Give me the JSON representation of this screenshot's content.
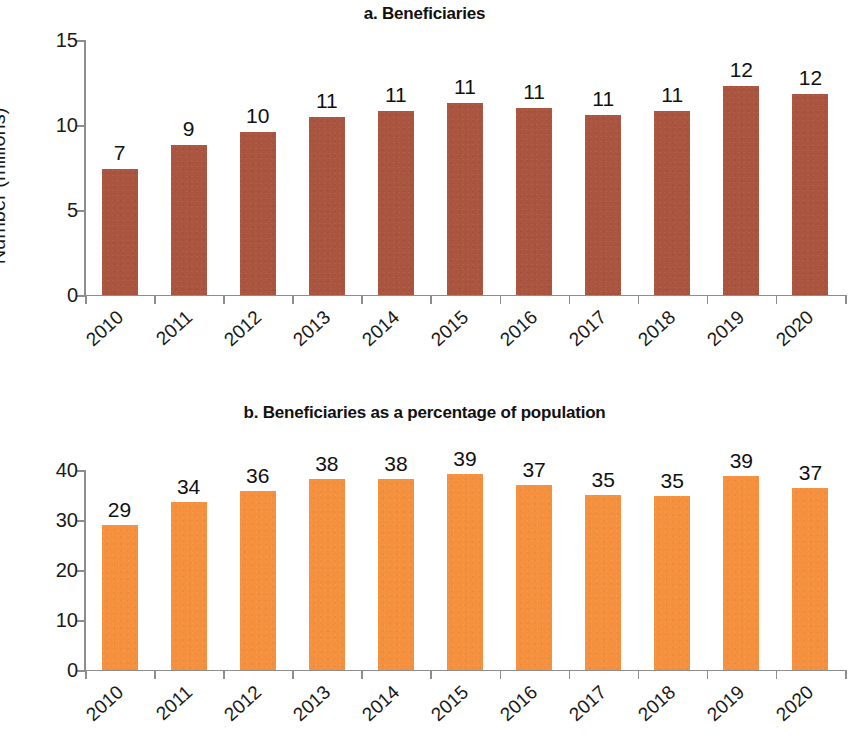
{
  "figure": {
    "panels": [
      "a",
      "b"
    ],
    "background": "#ffffff"
  },
  "chart_data": [
    {
      "type": "bar",
      "panel": "a",
      "title": "a. Beneficiaries",
      "xlabel": "",
      "ylabel": "Number (millions)",
      "categories": [
        "2010",
        "2011",
        "2012",
        "2013",
        "2014",
        "2015",
        "2016",
        "2017",
        "2018",
        "2019",
        "2020"
      ],
      "values": [
        7.4,
        8.8,
        9.6,
        10.5,
        10.8,
        11.3,
        11.0,
        10.6,
        10.8,
        12.3,
        11.8
      ],
      "data_labels": [
        "7",
        "9",
        "10",
        "11",
        "11",
        "11",
        "11",
        "11",
        "11",
        "12",
        "12"
      ],
      "ylim": [
        0,
        15
      ],
      "yticks": [
        0,
        5,
        10,
        15
      ],
      "ytick_labels": [
        "0",
        "5",
        "10",
        "15"
      ],
      "bar_color": "#aa5540",
      "grid": false,
      "legend": "none"
    },
    {
      "type": "bar",
      "panel": "b",
      "title": "b. Beneficiaries as a percentage of population",
      "xlabel": "",
      "ylabel": "Percent",
      "categories": [
        "2010",
        "2011",
        "2012",
        "2013",
        "2014",
        "2015",
        "2016",
        "2017",
        "2018",
        "2019",
        "2020"
      ],
      "values": [
        29.0,
        33.7,
        35.8,
        38.2,
        38.2,
        39.2,
        37.1,
        35.1,
        34.8,
        38.9,
        36.5
      ],
      "data_labels": [
        "29",
        "34",
        "36",
        "38",
        "38",
        "39",
        "37",
        "35",
        "35",
        "39",
        "37"
      ],
      "ylim": [
        0,
        40
      ],
      "yticks": [
        0,
        10,
        20,
        30,
        40
      ],
      "ytick_labels": [
        "0",
        "10",
        "20",
        "30",
        "40"
      ],
      "bar_color": "#f5913e",
      "grid": false,
      "legend": "none"
    }
  ]
}
